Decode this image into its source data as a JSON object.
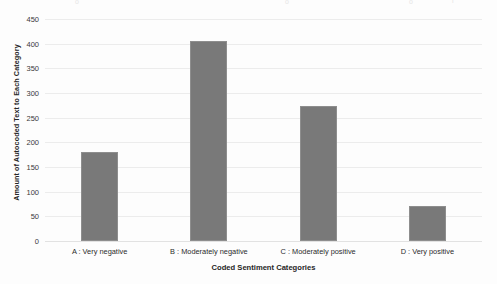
{
  "chart_data": {
    "type": "bar",
    "title": "",
    "subtitle": "",
    "xlabel": "Coded Sentiment Categories",
    "ylabel": "Amount of Autocoded Text to Each Category",
    "categories": [
      "A : Very negative",
      "B : Moderately negative",
      "C : Moderately positive",
      "D : Very positive"
    ],
    "values": [
      180,
      406,
      273,
      70
    ],
    "ylim": [
      0,
      450
    ],
    "ytick_labels": [
      "0",
      "50",
      "100",
      "150",
      "200",
      "250",
      "300",
      "350",
      "400",
      "450"
    ],
    "ytick_values": [
      0,
      50,
      100,
      150,
      200,
      250,
      300,
      350,
      400,
      450
    ],
    "grid": "horizontal",
    "legend": "none",
    "bar_color": "#797979",
    "gridline_color": "#ececec",
    "background_color": "#fdfdfd"
  },
  "artifacts": {
    "top_marks": [
      "a",
      "b",
      "c",
      "d"
    ]
  }
}
